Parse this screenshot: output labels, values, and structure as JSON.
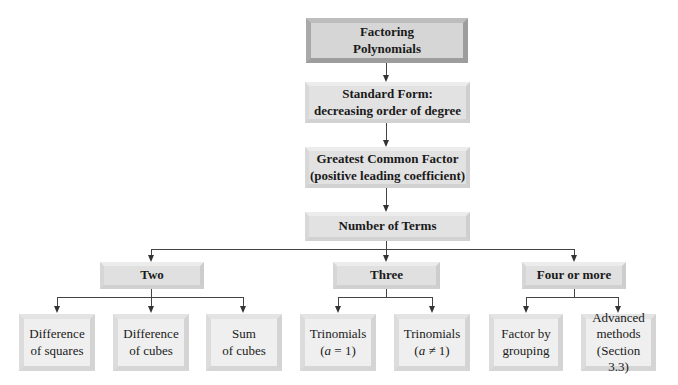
{
  "title": "Factoring Polynomials",
  "nodes": {
    "root": {
      "line1": "Factoring",
      "line2": "Polynomials"
    },
    "standard_form": {
      "line1": "Standard Form:",
      "line2": "decreasing order of degree"
    },
    "gcf": {
      "line1": "Greatest Common Factor",
      "line2": "(positive leading coefficient)"
    },
    "number_of_terms": {
      "line1": "Number of Terms"
    },
    "two": {
      "line1": "Two"
    },
    "three": {
      "line1": "Three"
    },
    "four_or_more": {
      "line1": "Four or more"
    },
    "diff_squares": {
      "line1": "Difference",
      "line2": "of squares"
    },
    "diff_cubes": {
      "line1": "Difference",
      "line2": "of cubes"
    },
    "sum_cubes": {
      "line1": "Sum",
      "line2": "of cubes"
    },
    "trinomial_a1": {
      "line1": "Trinomials",
      "var": "a",
      "rel": " = 1"
    },
    "trinomial_an1": {
      "line1": "Trinomials",
      "var": "a",
      "rel": " ≠ 1"
    },
    "grouping": {
      "line1": "Factor by",
      "line2": "grouping"
    },
    "advanced": {
      "line1": "Advanced",
      "line2": "methods",
      "line3": "(Section 3.3)"
    }
  },
  "edges": [
    [
      "root",
      "standard_form"
    ],
    [
      "standard_form",
      "gcf"
    ],
    [
      "gcf",
      "number_of_terms"
    ],
    [
      "number_of_terms",
      "two"
    ],
    [
      "number_of_terms",
      "three"
    ],
    [
      "number_of_terms",
      "four_or_more"
    ],
    [
      "two",
      "diff_squares"
    ],
    [
      "two",
      "diff_cubes"
    ],
    [
      "two",
      "sum_cubes"
    ],
    [
      "three",
      "trinomial_a1"
    ],
    [
      "three",
      "trinomial_an1"
    ],
    [
      "four_or_more",
      "grouping"
    ],
    [
      "four_or_more",
      "advanced"
    ]
  ]
}
